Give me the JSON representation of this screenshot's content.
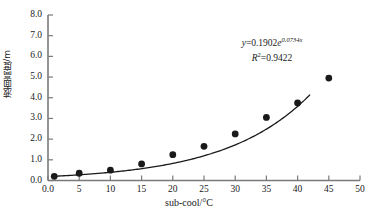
{
  "chart_data": {
    "type": "scatter",
    "title": "",
    "xlabel": "sub-cool/°C",
    "ylabel": "液面高度/m",
    "xlim": [
      0,
      50
    ],
    "ylim": [
      0,
      8
    ],
    "xticks": [
      "0.0",
      "5",
      "10",
      "15",
      "20",
      "25",
      "30",
      "35",
      "40",
      "45",
      "50"
    ],
    "xtick_values": [
      0,
      5,
      10,
      15,
      20,
      25,
      30,
      35,
      40,
      45,
      50
    ],
    "yticks": [
      "0.0",
      "1.0",
      "2.0",
      "3.0",
      "4.0",
      "5.0",
      "6.0",
      "7.0",
      "8.0"
    ],
    "ytick_values": [
      0,
      1,
      2,
      3,
      4,
      5,
      6,
      7,
      8
    ],
    "grid": false,
    "legend": null,
    "x": [
      1,
      5,
      10,
      15,
      20,
      25,
      30,
      35,
      40,
      45
    ],
    "values": [
      0.2,
      0.35,
      0.5,
      0.8,
      1.25,
      1.65,
      2.25,
      3.05,
      3.75,
      4.95
    ],
    "series": [
      {
        "name": "液面高度",
        "marker": "filled-circle",
        "color": "#1a1a1a",
        "points": [
          {
            "x": 1,
            "y": 0.2
          },
          {
            "x": 5,
            "y": 0.35
          },
          {
            "x": 10,
            "y": 0.5
          },
          {
            "x": 15,
            "y": 0.8
          },
          {
            "x": 20,
            "y": 1.25
          },
          {
            "x": 25,
            "y": 1.65
          },
          {
            "x": 30,
            "y": 2.25
          },
          {
            "x": 35,
            "y": 3.05
          },
          {
            "x": 40,
            "y": 3.75
          },
          {
            "x": 45,
            "y": 4.95
          }
        ]
      }
    ],
    "fit": {
      "type": "exponential",
      "coefficient": 0.1902,
      "exponent_rate": 0.0734,
      "r_squared": 0.9422,
      "x_start": 1,
      "x_end": 42,
      "color": "#1a1a1a"
    },
    "annotations": {
      "equation_prefix_y": "y",
      "equation_eq": "=0.1902",
      "equation_e": "e",
      "equation_exponent": "0.0734x",
      "r2_symbol": "R",
      "r2_sup": "2",
      "r2_value": "=0.9422"
    },
    "axis_color": "#7a7a7a"
  }
}
